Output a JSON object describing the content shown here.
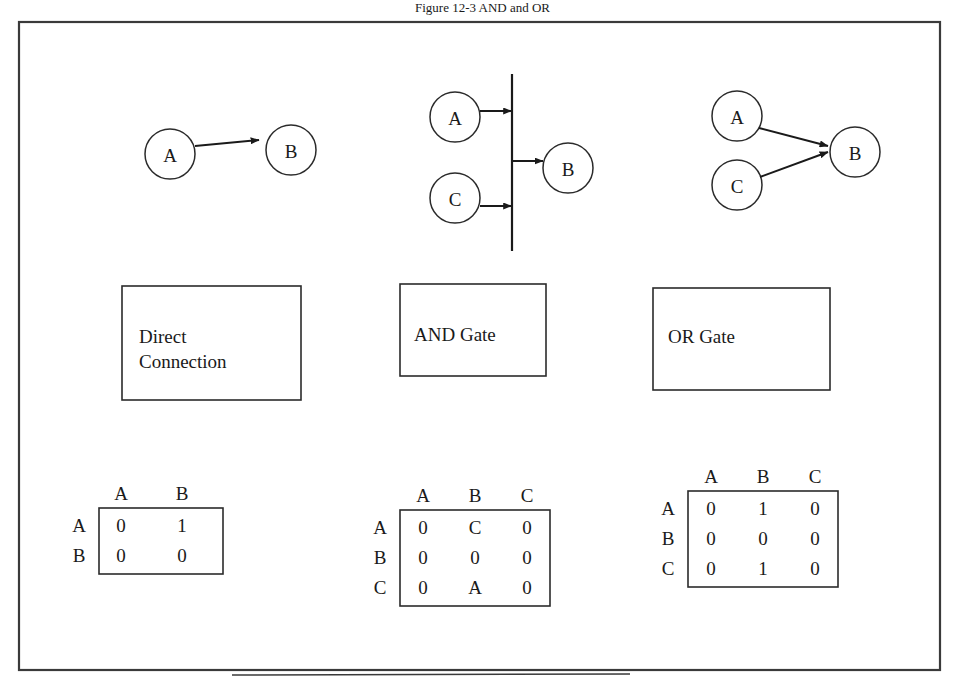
{
  "figure": {
    "caption": "Figure 12-3  AND and OR",
    "border_color": "#333333",
    "ink_color": "#1a1a1a",
    "background": "#ffffff"
  },
  "diagrams": [
    {
      "id": "direct-connection",
      "box_label": "Direct\nConnection",
      "box_label_line1": "Direct",
      "box_label_line2": "Connection",
      "nodes": [
        {
          "name": "A",
          "label": "A"
        },
        {
          "name": "B",
          "label": "B"
        }
      ],
      "edges": [
        {
          "from": "A",
          "to": "B"
        }
      ],
      "gate_bar": false
    },
    {
      "id": "and-gate",
      "box_label": "AND Gate",
      "box_label_line1": "AND Gate",
      "box_label_line2": "",
      "nodes": [
        {
          "name": "A",
          "label": "A"
        },
        {
          "name": "C",
          "label": "C"
        },
        {
          "name": "B",
          "label": "B"
        }
      ],
      "edges": [
        {
          "from": "A",
          "to": "bar"
        },
        {
          "from": "C",
          "to": "bar"
        },
        {
          "from": "bar",
          "to": "B"
        }
      ],
      "gate_bar": true
    },
    {
      "id": "or-gate",
      "box_label": "OR Gate",
      "box_label_line1": "OR Gate",
      "box_label_line2": "",
      "nodes": [
        {
          "name": "A",
          "label": "A"
        },
        {
          "name": "C",
          "label": "C"
        },
        {
          "name": "B",
          "label": "B"
        }
      ],
      "edges": [
        {
          "from": "A",
          "to": "B"
        },
        {
          "from": "C",
          "to": "B"
        }
      ],
      "gate_bar": false
    }
  ],
  "matrices": [
    {
      "id": "matrix-direct",
      "col_headers": [
        "A",
        "B"
      ],
      "row_headers": [
        "A",
        "B"
      ],
      "rows": [
        [
          "0",
          "1"
        ],
        [
          "0",
          "0"
        ]
      ]
    },
    {
      "id": "matrix-and",
      "col_headers": [
        "A",
        "B",
        "C"
      ],
      "row_headers": [
        "A",
        "B",
        "C"
      ],
      "rows": [
        [
          "0",
          "C",
          "0"
        ],
        [
          "0",
          "0",
          "0"
        ],
        [
          "0",
          "A",
          "0"
        ]
      ]
    },
    {
      "id": "matrix-or",
      "col_headers": [
        "A",
        "B",
        "C"
      ],
      "row_headers": [
        "A",
        "B",
        "C"
      ],
      "rows": [
        [
          "0",
          "1",
          "0"
        ],
        [
          "0",
          "0",
          "0"
        ],
        [
          "0",
          "1",
          "0"
        ]
      ]
    }
  ]
}
